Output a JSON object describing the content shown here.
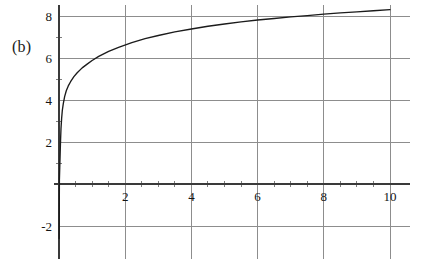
{
  "panel": {
    "label": "(b)"
  },
  "chart_data": {
    "type": "line",
    "title": "",
    "subtitle": "",
    "xlabel": "",
    "ylabel": "",
    "xlim": [
      -0.15,
      10.6
    ],
    "ylim": [
      -2.9,
      8.5
    ],
    "grid": true,
    "legend": null,
    "legend_position": "none",
    "xticks": [
      2,
      4,
      6,
      8,
      10
    ],
    "xtick_labels": [
      "2",
      "4",
      "6",
      "8",
      "10"
    ],
    "yticks": [
      -2,
      2,
      4,
      6,
      8
    ],
    "ytick_labels": [
      "-2",
      "2",
      "4",
      "6",
      "8"
    ],
    "gridlines_x": [
      2,
      4,
      6,
      8,
      10
    ],
    "gridlines_y": [
      -2,
      2,
      4,
      6,
      8
    ],
    "minor_xticks": [
      0.5,
      1,
      1.5,
      2.5,
      3,
      3.5,
      4.5,
      5,
      5.5,
      6.5,
      7,
      7.5,
      8.5,
      9,
      9.5
    ],
    "axis_origin": {
      "x": 0,
      "y": 0
    },
    "series": [
      {
        "name": "logarithmic-curve",
        "color": "#1b1b1b",
        "x": [
          0.045,
          0.06,
          0.08,
          0.1,
          0.13,
          0.17,
          0.22,
          0.28,
          0.35,
          0.45,
          0.55,
          0.7,
          0.85,
          1.0,
          1.2,
          1.5,
          1.8,
          2.2,
          2.6,
          3.0,
          3.5,
          4.0,
          4.5,
          5.0,
          5.5,
          6.0,
          6.5,
          7.0,
          7.5,
          8.0,
          8.5,
          9.0,
          9.5,
          10.0
        ],
        "y": [
          2.0,
          2.63,
          3.13,
          3.5,
          3.83,
          4.16,
          4.44,
          4.67,
          4.87,
          5.11,
          5.3,
          5.53,
          5.71,
          5.88,
          6.08,
          6.32,
          6.51,
          6.73,
          6.92,
          7.07,
          7.24,
          7.38,
          7.51,
          7.62,
          7.72,
          7.81,
          7.88,
          7.96,
          8.02,
          8.09,
          8.15,
          8.2,
          8.25,
          8.3
        ]
      }
    ]
  }
}
